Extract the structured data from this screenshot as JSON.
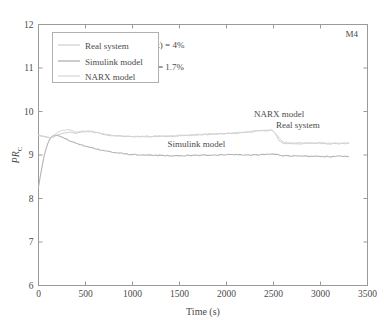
{
  "chart_data": {
    "type": "line",
    "title": "",
    "corner_label": "M4",
    "xlabel": "Time (s)",
    "ylabel": "PR",
    "ylabel_sub": "C",
    "xlim": [
      0,
      3500
    ],
    "ylim": [
      6,
      12
    ],
    "xticks": [
      0,
      500,
      1000,
      1500,
      2000,
      2500,
      3000,
      3500
    ],
    "yticks": [
      6,
      7,
      8,
      9,
      10,
      11,
      12
    ],
    "grid": false,
    "legend_position": "upper-left",
    "series": [
      {
        "name": "Real system",
        "color": "#c9c9c9",
        "x": [
          0,
          40,
          80,
          120,
          160,
          200,
          260,
          320,
          400,
          480,
          560,
          640,
          720,
          800,
          900,
          1000,
          1100,
          1200,
          1300,
          1400,
          1500,
          1600,
          1700,
          1800,
          1900,
          2000,
          2100,
          2200,
          2300,
          2400,
          2480,
          2520,
          2560,
          2600,
          2700,
          2800,
          2900,
          3000,
          3100,
          3200,
          3300
        ],
        "y": [
          9.45,
          9.44,
          9.42,
          9.4,
          9.41,
          9.46,
          9.5,
          9.52,
          9.5,
          9.53,
          9.54,
          9.5,
          9.46,
          9.44,
          9.43,
          9.42,
          9.42,
          9.42,
          9.43,
          9.43,
          9.44,
          9.45,
          9.46,
          9.47,
          9.48,
          9.49,
          9.5,
          9.52,
          9.54,
          9.56,
          9.57,
          9.5,
          9.32,
          9.27,
          9.26,
          9.26,
          9.27,
          9.27,
          9.26,
          9.26,
          9.27
        ]
      },
      {
        "name": "Simulink model",
        "color": "#b5b5b5",
        "x": [
          0,
          20,
          40,
          60,
          80,
          100,
          120,
          140,
          160,
          180,
          200,
          240,
          300,
          360,
          440,
          520,
          600,
          700,
          800,
          900,
          1000,
          1100,
          1200,
          1300,
          1400,
          1500,
          1600,
          1700,
          1800,
          1900,
          2000,
          2100,
          2200,
          2300,
          2400,
          2500,
          2600,
          2700,
          2800,
          2900,
          3000,
          3100,
          3200,
          3300
        ],
        "y": [
          8.26,
          8.52,
          8.76,
          8.98,
          9.14,
          9.27,
          9.36,
          9.42,
          9.45,
          9.46,
          9.45,
          9.42,
          9.36,
          9.3,
          9.24,
          9.19,
          9.15,
          9.1,
          9.06,
          9.03,
          9.01,
          9.0,
          8.99,
          8.99,
          8.98,
          8.98,
          8.99,
          8.99,
          9.0,
          9.0,
          9.01,
          9.01,
          9.0,
          9.0,
          9.01,
          9.02,
          8.99,
          8.98,
          8.97,
          8.97,
          8.97,
          8.96,
          8.97,
          8.97
        ]
      },
      {
        "name": "NARX model",
        "color": "#d2d2d2",
        "x": [
          0,
          40,
          80,
          120,
          160,
          200,
          260,
          320,
          400,
          480,
          560,
          640,
          720,
          800,
          900,
          1000,
          1100,
          1200,
          1300,
          1400,
          1500,
          1600,
          1700,
          1800,
          1900,
          2000,
          2100,
          2200,
          2300,
          2400,
          2480,
          2540,
          2600,
          2700,
          2800,
          2900,
          3000,
          3100,
          3200,
          3300
        ],
        "y": [
          9.44,
          9.43,
          9.41,
          9.39,
          9.43,
          9.52,
          9.57,
          9.58,
          9.53,
          9.55,
          9.56,
          9.51,
          9.47,
          9.45,
          9.44,
          9.43,
          9.43,
          9.43,
          9.44,
          9.44,
          9.45,
          9.46,
          9.47,
          9.48,
          9.49,
          9.5,
          9.51,
          9.53,
          9.55,
          9.57,
          9.58,
          9.44,
          9.3,
          9.28,
          9.28,
          9.28,
          9.28,
          9.27,
          9.27,
          9.28
        ]
      }
    ],
    "annotations": [
      {
        "text": "RMSE(Simulink) = 4%",
        "x": 1100,
        "y": 11.45
      },
      {
        "text": "RMSE(NARX) = 1.7%",
        "x": 1100,
        "y": 10.95
      },
      {
        "text": "NARX model",
        "x": 2560,
        "y": 9.88
      },
      {
        "text": "Real system",
        "x": 2760,
        "y": 9.62
      },
      {
        "text": "Simulink model",
        "x": 1680,
        "y": 9.18
      }
    ]
  },
  "legend": {
    "items": [
      {
        "label": "Real system"
      },
      {
        "label": "Simulink model"
      },
      {
        "label": "NARX model"
      }
    ]
  },
  "axis": {
    "x_title": "Time (s)",
    "y_title": "PR",
    "y_title_sub": "C"
  },
  "colors": {
    "axis": "#8a8a8a",
    "text": "#4a4a4a",
    "background": "#ffffff"
  }
}
